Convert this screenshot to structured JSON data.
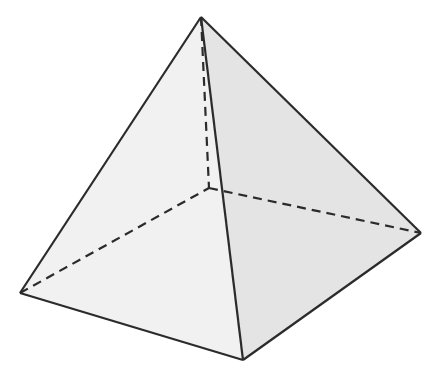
{
  "diagram": {
    "type": "square-pyramid",
    "vertices": {
      "apex": [
        201,
        17
      ],
      "back": [
        209,
        188
      ],
      "left": [
        20,
        293
      ],
      "front": [
        243,
        360
      ],
      "right": [
        421,
        233
      ]
    },
    "colors": {
      "edge": "#2b2b2b",
      "left_face": "#f1f1f1",
      "right_face": "#e4e4e4",
      "background": "#ffffff"
    }
  }
}
